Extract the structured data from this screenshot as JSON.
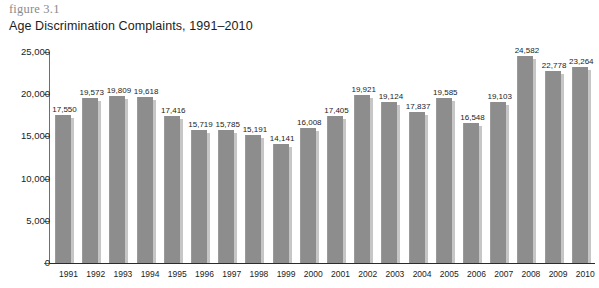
{
  "figure": {
    "number": "figure 3.1",
    "title": "Age Discrimination Complaints, 1991–2010"
  },
  "chart_data": {
    "type": "bar",
    "title": "Age Discrimination Complaints, 1991–2010",
    "xlabel": "",
    "ylabel": "",
    "ylim": [
      0,
      25000
    ],
    "ytick_labels": [
      "0",
      "5,000",
      "10,000",
      "15,000",
      "20,000",
      "25,000"
    ],
    "ytick_values": [
      0,
      5000,
      10000,
      15000,
      20000,
      25000
    ],
    "grid": false,
    "legend": "none",
    "categories": [
      "1991",
      "1992",
      "1993",
      "1994",
      "1995",
      "1996",
      "1997",
      "1998",
      "1999",
      "2000",
      "2001",
      "2002",
      "2003",
      "2004",
      "2005",
      "2006",
      "2007",
      "2008",
      "2009",
      "2010"
    ],
    "values": [
      17550,
      19573,
      19809,
      19618,
      17416,
      15719,
      15785,
      15191,
      14141,
      16008,
      17405,
      19921,
      19124,
      17837,
      19585,
      16548,
      19103,
      24582,
      22778,
      23264
    ],
    "value_labels": [
      "17,550",
      "19,573",
      "19,809",
      "19,618",
      "17,416",
      "15,719",
      "15,785",
      "15,191",
      "14,141",
      "16,008",
      "17,405",
      "19,921",
      "19,124",
      "17,837",
      "19,585",
      "16,548",
      "19,103",
      "24,582",
      "22,778",
      "23,264"
    ],
    "bar_color": "#8d8d8d",
    "bar_edge_color": "#c6c6c6",
    "axis_color": "#2b2b2b"
  }
}
